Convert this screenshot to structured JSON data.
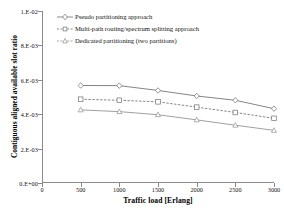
{
  "chart_data": {
    "type": "line",
    "title": "",
    "xlabel": "Traffic load [Erlang]",
    "ylabel": "Contiguous aligned available slot ratio",
    "x": [
      500,
      1000,
      1500,
      2000,
      2500,
      3000
    ],
    "xlim": [
      0,
      3000
    ],
    "ylim": [
      0,
      0.01
    ],
    "xticks": [
      "0",
      "500",
      "1000",
      "1500",
      "2000",
      "2500",
      "3000"
    ],
    "xtick_values": [
      0,
      500,
      1000,
      1500,
      2000,
      2500,
      3000
    ],
    "yticks": [
      "0.E+00",
      "2.E-03",
      "4.E-03",
      "6.E-03",
      "8.E-03",
      "1.E-02"
    ],
    "ytick_values": [
      0,
      0.002,
      0.004,
      0.006,
      0.008,
      0.01
    ],
    "grid": false,
    "legend_position": "top-left",
    "series": [
      {
        "name": "Pseudo partitioning approach",
        "linestyle": "solid",
        "marker": "diamond",
        "color": "#6f6f6f",
        "values": [
          0.00567,
          0.00566,
          0.00538,
          0.00506,
          0.00481,
          0.00432
        ]
      },
      {
        "name": "Multi-path routing/spectrum splitting  approach",
        "linestyle": "dashed",
        "marker": "square",
        "color": "#6f6f6f",
        "values": [
          0.00487,
          0.00481,
          0.00472,
          0.00441,
          0.0041,
          0.00376
        ]
      },
      {
        "name": "Dedicated partitioning (two partitions)",
        "linestyle": "solid",
        "marker": "triangle",
        "color": "#8f8f8f",
        "values": [
          0.00425,
          0.00415,
          0.00397,
          0.00367,
          0.00336,
          0.00306
        ]
      }
    ]
  }
}
